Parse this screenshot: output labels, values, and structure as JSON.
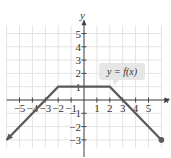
{
  "chart_data": {
    "type": "line",
    "title": "",
    "xlabel": "x",
    "ylabel": "y",
    "xlim": [
      -6,
      6
    ],
    "ylim": [
      -4,
      6
    ],
    "grid": true,
    "x_ticks": [
      -5,
      -4,
      -3,
      -2,
      -1,
      1,
      2,
      3,
      4,
      5
    ],
    "y_ticks": [
      -3,
      -2,
      -1,
      1,
      2,
      3,
      4,
      5
    ],
    "series": [
      {
        "name": "y = f(x)",
        "points": [
          [
            -6,
            -3
          ],
          [
            -2,
            1
          ],
          [
            2,
            1
          ],
          [
            6,
            -3
          ]
        ],
        "left_end": "arrow",
        "right_end": "closed-dot",
        "color": "#595959"
      }
    ],
    "annotations": [
      {
        "text": "y = f(x)",
        "at": [
          4,
          2.5
        ],
        "style": "callout-box"
      }
    ]
  },
  "labels": {
    "x_axis": "x",
    "y_axis": "y",
    "function": "y = f(x)"
  }
}
